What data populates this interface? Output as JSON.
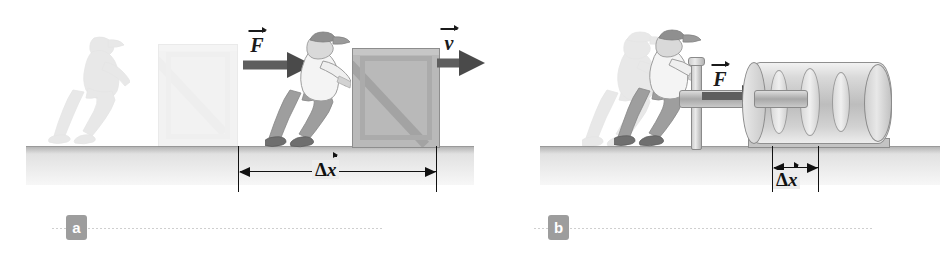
{
  "figure": {
    "panels": [
      {
        "id": "a",
        "badge": "a",
        "force_label": "F",
        "velocity_label": "v",
        "displacement_label": "x",
        "delta_symbol": "Δ",
        "description": "Person pushes a large crate a long distance",
        "ghost_description": "faded initial position of person and crate"
      },
      {
        "id": "b",
        "badge": "b",
        "force_label": "F",
        "displacement_label": "x",
        "delta_symbol": "Δ",
        "description": "Person pushes a heavy roller a short distance",
        "ghost_description": "faded initial position of person"
      }
    ]
  },
  "colors": {
    "ground_top": "#dcdcdc",
    "ground_bottom": "#f7f7f7",
    "crate_fill": "#b9b9b9",
    "arrow_fill": "#4a4a4a",
    "badge_fill": "#9d9d9d",
    "badge_text": "#ffffff",
    "label_text": "#1a1a1a",
    "background": "#ffffff"
  }
}
